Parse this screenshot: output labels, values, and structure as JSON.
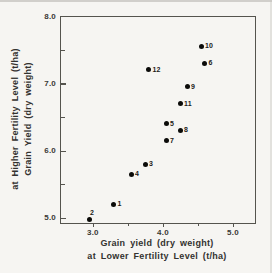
{
  "figure": {
    "background_color": "#f6f5f2",
    "frame_color": "#55544e",
    "marker_color": "#0b0b09",
    "text_color": "#33322f"
  },
  "chart_data": {
    "type": "scatter",
    "title": "",
    "xlabel_line1": "Grain yield (dry weight)",
    "xlabel_line2": "at Lower Fertility Level (t/ha)",
    "ylabel_line1": "Grain Yield (dry weight)",
    "ylabel_line2": "at Higher Fertility Level (t/ha)",
    "xlim": [
      2.53,
      5.3
    ],
    "ylim": [
      4.94,
      8.0
    ],
    "x_major_ticks": [
      3.0,
      4.0,
      5.0
    ],
    "x_tick_labels": [
      "3.0",
      "4.0",
      "5.0"
    ],
    "x_minor_ticks": [
      3.5,
      4.5
    ],
    "y_major_ticks": [
      8.0,
      7.0,
      6.0,
      5.0
    ],
    "y_tick_labels": [
      "8.0",
      "7.0",
      "6.0",
      "5.0"
    ],
    "y_minor_ticks": [
      7.5,
      6.5,
      5.5
    ],
    "grid": false,
    "legend": false,
    "marker": "filled-circle",
    "points": [
      {
        "label": "1",
        "x": 3.3,
        "y": 5.2,
        "label_side": "right"
      },
      {
        "label": "2",
        "x": 2.95,
        "y": 4.98,
        "label_side": "above-right"
      },
      {
        "label": "3",
        "x": 3.75,
        "y": 5.8,
        "label_side": "right"
      },
      {
        "label": "4",
        "x": 3.55,
        "y": 5.65,
        "label_side": "right"
      },
      {
        "label": "5",
        "x": 4.05,
        "y": 6.4,
        "label_side": "right"
      },
      {
        "label": "6",
        "x": 4.6,
        "y": 7.3,
        "label_side": "right"
      },
      {
        "label": "7",
        "x": 4.05,
        "y": 6.15,
        "label_side": "right"
      },
      {
        "label": "8",
        "x": 4.25,
        "y": 6.3,
        "label_side": "right"
      },
      {
        "label": "9",
        "x": 4.35,
        "y": 6.95,
        "label_side": "right"
      },
      {
        "label": "10",
        "x": 4.55,
        "y": 7.55,
        "label_side": "right"
      },
      {
        "label": "11",
        "x": 4.25,
        "y": 6.7,
        "label_side": "right"
      },
      {
        "label": "12",
        "x": 3.8,
        "y": 7.2,
        "label_side": "right"
      }
    ]
  }
}
